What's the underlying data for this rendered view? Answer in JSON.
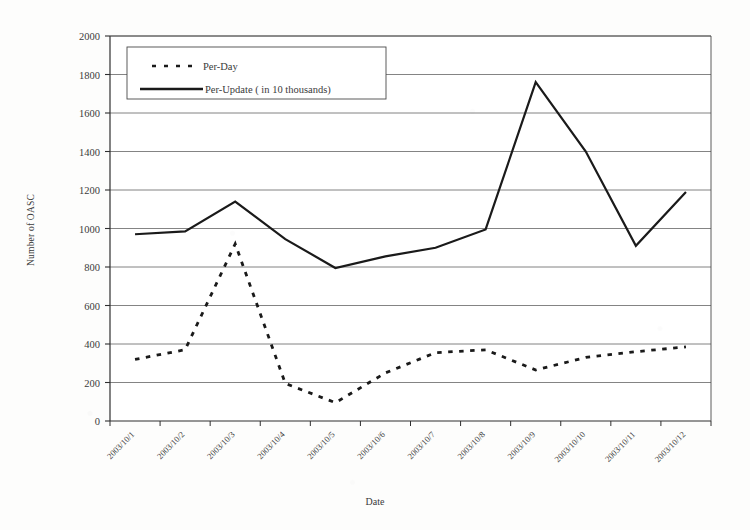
{
  "chart_data": {
    "type": "line",
    "title": "",
    "xlabel": "Date",
    "ylabel": "Number of OASC",
    "ylim": [
      0,
      2000
    ],
    "ytick_step": 200,
    "yticks": [
      "0",
      "200",
      "400",
      "600",
      "800",
      "1000",
      "1200",
      "1400",
      "1600",
      "1800",
      "2000"
    ],
    "grid": "horizontal",
    "legend_position": "top-left-inside",
    "categories": [
      "2003/10/1",
      "2003/10/2",
      "2003/10/3",
      "2003/10/4",
      "2003/10/5",
      "2003/10/6",
      "2003/10/7",
      "2003/10/8",
      "2003/10/9",
      "2003/10/10",
      "2003/10/11",
      "2003/10/12"
    ],
    "series": [
      {
        "name": "Per-Day",
        "style": "dashed",
        "color": "#1a1a1a",
        "values": [
          320,
          370,
          920,
          195,
          95,
          250,
          355,
          370,
          265,
          330,
          360,
          385
        ]
      },
      {
        "name": "Per-Update ( in 10 thousands)",
        "style": "solid",
        "color": "#1a1a1a",
        "values": [
          970,
          985,
          1140,
          945,
          795,
          855,
          900,
          995,
          1760,
          1400,
          910,
          1190
        ]
      }
    ]
  },
  "legend": {
    "entries": [
      {
        "label": "Per-Day",
        "marker": "dashed-line-swatch"
      },
      {
        "label": "Per-Update ( in 10 thousands)",
        "marker": "solid-line-swatch"
      }
    ]
  },
  "axes": {
    "x_title": "Date",
    "y_title": "Number of OASC"
  }
}
